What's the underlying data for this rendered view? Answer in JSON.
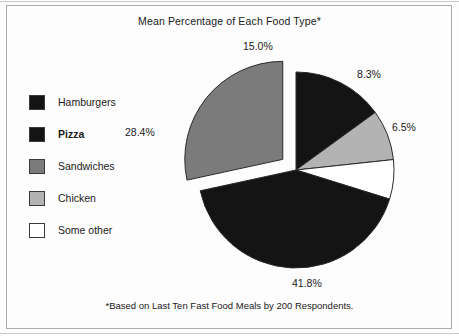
{
  "chart_data": {
    "type": "pie",
    "title": "Mean Percentage of Each Food Type*",
    "footnote": "*Based on Last Ten Fast Food Meals by 200 Respondents.",
    "categories": [
      "Hamburgers",
      "Pizza",
      "Sandwiches",
      "Chicken",
      "Some other"
    ],
    "values": [
      15.0,
      41.8,
      28.4,
      8.3,
      6.5
    ],
    "value_labels": [
      "15.0%",
      "41.8%",
      "28.4%",
      "8.3%",
      "6.5%"
    ],
    "units": "percent",
    "total": 100.0,
    "start_angle_deg": 0,
    "direction": "clockwise",
    "draw_order": [
      "Hamburgers",
      "Chicken",
      "Some other",
      "Pizza",
      "Sandwiches"
    ],
    "exploded_slices": [
      "Sandwiches"
    ],
    "legend_position": "left",
    "grid": false,
    "slices": [
      {
        "name": "Hamburgers",
        "value": 15.0,
        "label": "15.0%",
        "color": "#141414",
        "exploded": false,
        "start_deg": 0.0,
        "end_deg": 54.0
      },
      {
        "name": "Chicken",
        "value": 8.3,
        "label": "8.3%",
        "color": "#b3b3b3",
        "exploded": false,
        "start_deg": 54.0,
        "end_deg": 83.88
      },
      {
        "name": "Some other",
        "value": 6.5,
        "label": "6.5%",
        "color": "#ffffff",
        "exploded": false,
        "start_deg": 83.88,
        "end_deg": 107.28
      },
      {
        "name": "Pizza",
        "value": 41.8,
        "label": "41.8%",
        "color": "#141414",
        "exploded": false,
        "start_deg": 107.28,
        "end_deg": 257.76
      },
      {
        "name": "Sandwiches",
        "value": 28.4,
        "label": "28.4%",
        "color": "#7b7b7b",
        "exploded": true,
        "start_deg": 257.76,
        "end_deg": 360.0
      }
    ]
  },
  "chart": {
    "title": "Mean Percentage of Each Food Type*",
    "footnote": "*Based on Last Ten Fast Food Meals by 200 Respondents."
  },
  "legend": {
    "items": [
      {
        "label": "Hamburgers",
        "color": "#141414",
        "bold": false
      },
      {
        "label": "Pizza",
        "color": "#141414",
        "bold": true
      },
      {
        "label": "Sandwiches",
        "color": "#7b7b7b",
        "bold": false
      },
      {
        "label": "Chicken",
        "color": "#b3b3b3",
        "bold": false
      },
      {
        "label": "Some other",
        "color": "#ffffff",
        "bold": false
      }
    ]
  },
  "labels": {
    "hamburgers": "15.0%",
    "chicken": "8.3%",
    "someother": "6.5%",
    "pizza": "41.8%",
    "sandwiches": "28.4%"
  },
  "colors": {
    "dark": "#141414",
    "mid_gray": "#7b7b7b",
    "light_gray": "#b3b3b3",
    "white": "#ffffff",
    "outline": "#2a2a2a",
    "background": "#fdfdfd"
  }
}
